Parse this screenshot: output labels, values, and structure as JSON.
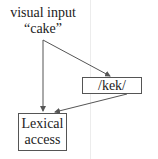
{
  "diagram": {
    "input_label": "visual input",
    "input_word": "“cake”",
    "phonology_box": "/kek/",
    "lexical_box_line1": "Lexical",
    "lexical_box_line2": "access",
    "edges": [
      {
        "from": "visual input",
        "to": "Lexical access"
      },
      {
        "from": "visual input",
        "to": "/kek/"
      },
      {
        "from": "/kek/",
        "to": "Lexical access"
      }
    ],
    "colors": {
      "line": "#555555",
      "text": "#222222",
      "guide": "#ececec"
    }
  }
}
